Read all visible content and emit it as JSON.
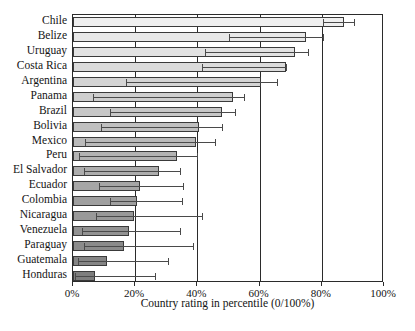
{
  "chart_data": {
    "type": "bar",
    "title": "",
    "subtitle": "",
    "xlabel": "Country rating in percentile (0/100%)",
    "ylabel": "",
    "xlim": [
      0,
      100
    ],
    "xticks": [
      0,
      20,
      40,
      60,
      80,
      100
    ],
    "xtick_labels": [
      "0%",
      "20%",
      "40%",
      "60%",
      "80%",
      "100%"
    ],
    "grid": true,
    "grid_axis": "x",
    "legend": "none",
    "orientation": "horizontal",
    "note": "Each country is drawn as a horizontal interval (box) with an extending whisker to an upper bound; bars are shaded progressively darker from top to bottom.",
    "categories": [
      "Chile",
      "Belize",
      "Uruguay",
      "Costa Rica",
      "Argentina",
      "Panama",
      "Brazil",
      "Bolivia",
      "Mexico",
      "Peru",
      "El Salvador",
      "Ecuador",
      "Colombia",
      "Nicaragua",
      "Venezuela",
      "Paraguay",
      "Guatemala",
      "Honduras"
    ],
    "series": [
      {
        "name": "Interval lower bound",
        "values": [
          80.5,
          50.0,
          42.5,
          41.5,
          17.0,
          6.5,
          12.0,
          9.0,
          4.0,
          2.0,
          3.5,
          8.5,
          12.0,
          7.5,
          3.0,
          3.5,
          1.5,
          0.5
        ]
      },
      {
        "name": "Country rating (upper edge of box)",
        "values": [
          87.0,
          75.0,
          71.5,
          68.5,
          60.5,
          51.5,
          48.0,
          40.5,
          39.5,
          33.5,
          27.5,
          21.5,
          20.5,
          19.5,
          18.0,
          16.5,
          11.0,
          7.0
        ]
      },
      {
        "name": "Upper confidence limit (whisker end)",
        "values": [
          90.5,
          80.5,
          75.5,
          68.5,
          65.5,
          55.0,
          52.0,
          48.0,
          45.5,
          40.0,
          34.5,
          35.5,
          35.0,
          41.5,
          34.5,
          38.5,
          30.5,
          26.5
        ]
      }
    ]
  },
  "axis": {
    "x_title": "Country rating in percentile (0/100%)"
  },
  "footnote": {
    "text": ""
  },
  "colors": {
    "frame": "#2b2b2b",
    "gridline": "#2b2b2b",
    "bar_stroke": "#3a3a3a",
    "whisker": "#4a4a4a",
    "background": "#ffffff",
    "bar_light": "#efefef",
    "bar_dark": "#7e7e7e"
  }
}
